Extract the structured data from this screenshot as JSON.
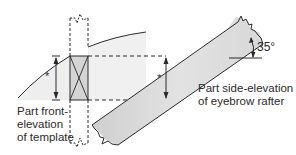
{
  "diagram": {
    "labels": {
      "front_line1": "Part front-",
      "front_line2": "elevation",
      "front_line3": "of template",
      "side_line1": "Part side-elevation",
      "side_line2": "of eyebrow rafter"
    },
    "angle": "35°",
    "dimension_marker": "*",
    "colors": {
      "line": "#2a2a2a",
      "fill_light": "#e6e6e6",
      "fill_template": "#d2d2d2",
      "fill_rafter": "#dcdcdc",
      "background": "#ffffff"
    }
  }
}
